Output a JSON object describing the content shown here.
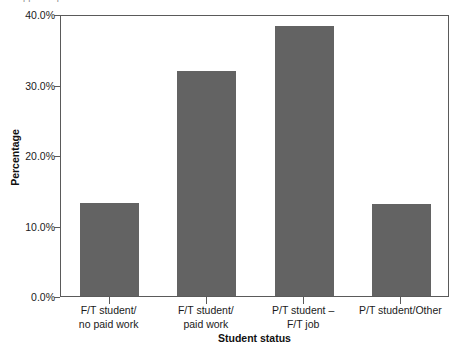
{
  "top_caption": {
    "text": "clipped caption text above chart"
  },
  "chart_data": {
    "type": "bar",
    "title": "",
    "xlabel": "Student status",
    "ylabel": "Percentage",
    "categories": [
      "F/T student/\nno paid work",
      "F/T student/\npaid work",
      "P/T student –\nF/T job",
      "P/T student/Other"
    ],
    "category_lines": [
      [
        "F/T student/",
        "no paid work"
      ],
      [
        "F/T student/",
        "paid work"
      ],
      [
        "P/T student –",
        "F/T job"
      ],
      [
        "P/T student/Other",
        ""
      ]
    ],
    "values": [
      13.2,
      31.9,
      38.3,
      13.0
    ],
    "ylim": [
      0,
      40
    ],
    "ytick_values": [
      0,
      10,
      20,
      30,
      40
    ],
    "ytick_labels": [
      "0.0%",
      "10.0%",
      "20.0%",
      "30.0%",
      "40.0%"
    ],
    "grid": false,
    "legend": "none",
    "bar_color": "#636363",
    "axis_color": "#5a5a5a"
  }
}
